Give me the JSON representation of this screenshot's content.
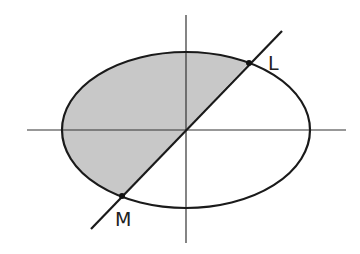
{
  "diagram": {
    "type": "ellipse-with-chord",
    "colors": {
      "background": "#ffffff",
      "stroke": "#1a1a1a",
      "axis": "#333333",
      "shade": "#c8c8c8"
    },
    "labels": {
      "point_upper": "L",
      "point_lower": "M"
    },
    "geometry": {
      "center": [
        186,
        130
      ],
      "ellipse_rx": 124,
      "ellipse_ry": 78,
      "x_axis": [
        27,
        346
      ],
      "y_axis": [
        15,
        243
      ],
      "line_start": [
        91,
        229
      ],
      "line_end": [
        282,
        31
      ],
      "point_L": [
        249,
        63
      ],
      "point_M": [
        122,
        196
      ]
    }
  }
}
